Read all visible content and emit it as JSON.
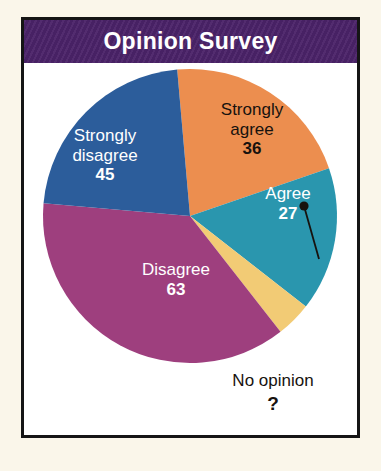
{
  "header": {
    "title": "Opinion Survey",
    "bg_color": "#4b2369",
    "text_color": "#ffffff"
  },
  "frame": {
    "border_color": "#151515",
    "page_bg": "#faf6ea",
    "card_bg": "#ffffff"
  },
  "chart_data": {
    "type": "pie",
    "title": "Opinion Survey",
    "xlabel": "",
    "ylabel": "",
    "grid": false,
    "legend": "none (labels on slices)",
    "categories": [
      "Strongly agree",
      "Agree",
      "No opinion",
      "Disagree",
      "Strongly disagree"
    ],
    "values": [
      36,
      27,
      null,
      63,
      45
    ],
    "value_labels": [
      "36",
      "27",
      "?",
      "63",
      "45"
    ],
    "colors": [
      "#ec8e4f",
      "#2a96ae",
      "#f2cb75",
      "#9e3f7e",
      "#2c5d9b"
    ],
    "annotations": [
      "No opinion value is unknown, marked with a question mark and a leader line to its slice"
    ],
    "slices": [
      {
        "name": "Strongly agree",
        "label_line1": "Strongly",
        "label_line2": "agree",
        "value": "36",
        "color": "#ec8e4f",
        "label_color": "#17120e",
        "start_deg": 355,
        "end_deg": 71,
        "callout": false
      },
      {
        "name": "Agree",
        "label_line1": "Agree",
        "label_line2": "",
        "value": "27",
        "color": "#2a96ae",
        "label_color": "#ffffff",
        "start_deg": 71,
        "end_deg": 128,
        "callout": false
      },
      {
        "name": "No opinion",
        "label_line1": "No opinion",
        "label_line2": "",
        "value": "?",
        "color": "#f2cb75",
        "label_color": "#17120e",
        "start_deg": 128,
        "end_deg": 142,
        "callout": true
      },
      {
        "name": "Disagree",
        "label_line1": "Disagree",
        "label_line2": "",
        "value": "63",
        "color": "#9e3f7e",
        "label_color": "#ffffff",
        "start_deg": 142,
        "end_deg": 275,
        "callout": false
      },
      {
        "name": "Strongly disagree",
        "label_line1": "Strongly",
        "label_line2": "disagree",
        "value": "45",
        "color": "#2c5d9b",
        "label_color": "#ffffff",
        "start_deg": 275,
        "end_deg": 355,
        "callout": false
      }
    ]
  }
}
